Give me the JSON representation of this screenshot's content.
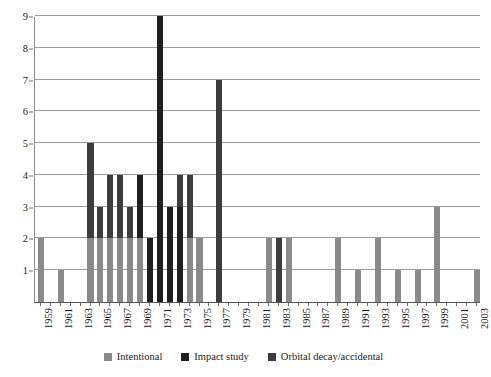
{
  "chart_data": {
    "type": "bar",
    "stacked": true,
    "title": "",
    "subtitle": "",
    "xlabel": "",
    "ylabel": "",
    "ylim": [
      0,
      9
    ],
    "ytick_step": 1,
    "ytick_labels": [
      "0",
      "1",
      "2",
      "3",
      "4",
      "5",
      "6",
      "7",
      "8",
      "9"
    ],
    "grid": true,
    "legend_position": "bottom",
    "x": [
      1959,
      1960,
      1961,
      1962,
      1963,
      1964,
      1965,
      1966,
      1967,
      1968,
      1969,
      1970,
      1971,
      1972,
      1973,
      1974,
      1975,
      1976,
      1977,
      1978,
      1979,
      1980,
      1981,
      1982,
      1983,
      1984,
      1985,
      1986,
      1987,
      1988,
      1989,
      1990,
      1991,
      1992,
      1993,
      1994,
      1995,
      1996,
      1997,
      1998,
      1999,
      2000,
      2001,
      2002,
      2003
    ],
    "xtick_labels": [
      "1959",
      "1961",
      "1963",
      "1965",
      "1967",
      "1969",
      "1971",
      "1973",
      "1975",
      "1977",
      "1979",
      "1981",
      "1983",
      "1985",
      "1987",
      "1989",
      "1991",
      "1993",
      "1995",
      "1997",
      "1999",
      "2001",
      "2003"
    ],
    "xtick_step": 2,
    "series": [
      {
        "name": "Intentional",
        "color": "#8a8a8a",
        "values": [
          2,
          0,
          1,
          0,
          0,
          2,
          2,
          2,
          2,
          2,
          2,
          0,
          0,
          0,
          0,
          2,
          2,
          0,
          0,
          0,
          0,
          0,
          0,
          2,
          0,
          2,
          0,
          0,
          0,
          0,
          2,
          0,
          1,
          0,
          2,
          0,
          1,
          0,
          1,
          0,
          3,
          0,
          0,
          0,
          1
        ]
      },
      {
        "name": "Impact study",
        "color": "#1f1f1f",
        "values": [
          0,
          0,
          0,
          0,
          0,
          0,
          0,
          0,
          0,
          0,
          2,
          2,
          9,
          3,
          3,
          0,
          0,
          0,
          0,
          0,
          0,
          0,
          0,
          0,
          0,
          0,
          0,
          0,
          0,
          0,
          0,
          0,
          0,
          0,
          0,
          0,
          0,
          0,
          0,
          0,
          0,
          0,
          0,
          0,
          0
        ]
      },
      {
        "name": "Orbital decay/accidental",
        "color": "#3d3d3d",
        "values": [
          0,
          0,
          0,
          0,
          0,
          3,
          1,
          2,
          2,
          1,
          0,
          0,
          0,
          0,
          1,
          2,
          0,
          0,
          7,
          0,
          0,
          0,
          0,
          0,
          2,
          0,
          0,
          0,
          0,
          0,
          0,
          0,
          0,
          0,
          0,
          0,
          0,
          0,
          0,
          0,
          0,
          0,
          0,
          0,
          0
        ]
      }
    ],
    "totals": [
      2,
      0,
      1,
      0,
      0,
      5,
      3,
      4,
      4,
      3,
      4,
      2,
      9,
      3,
      4,
      4,
      2,
      0,
      7,
      0,
      0,
      0,
      0,
      2,
      2,
      2,
      0,
      0,
      0,
      0,
      2,
      0,
      1,
      0,
      2,
      0,
      1,
      0,
      1,
      0,
      3,
      0,
      0,
      0,
      1
    ]
  },
  "legend": {
    "items": [
      {
        "label": "Intentional",
        "color": "#8a8a8a"
      },
      {
        "label": "Impact study",
        "color": "#1f1f1f"
      },
      {
        "label": "Orbital decay/accidental",
        "color": "#3d3d3d"
      }
    ]
  }
}
